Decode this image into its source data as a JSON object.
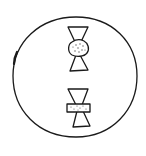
{
  "diagram": {
    "cell": {
      "shape": "circle",
      "stroke": "#1a1a1a",
      "fill": "#ffffff"
    },
    "chromosomes": [
      {
        "id": "upper",
        "centromere_shape": "round-dotted"
      },
      {
        "id": "lower",
        "centromere_shape": "rectangular-dotted"
      }
    ]
  }
}
